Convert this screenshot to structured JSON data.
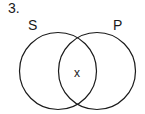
{
  "problem_number": "3.",
  "venn": {
    "sets": [
      {
        "label": "S",
        "cx": 58,
        "cy": 71,
        "r": 38.5
      },
      {
        "label": "P",
        "cx": 97,
        "cy": 71,
        "r": 38.5
      }
    ],
    "marks": [
      {
        "label": "x",
        "region": "S∩P"
      }
    ],
    "stroke_color": "#1a1a1a"
  }
}
